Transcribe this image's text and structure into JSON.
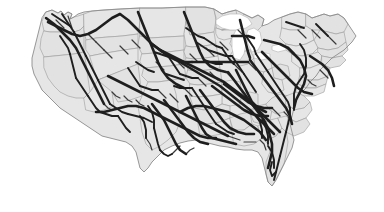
{
  "figure": {
    "kind": "map",
    "width_px": 384,
    "height_px": 212,
    "background_color": "#ffffff",
    "has_labels": false,
    "has_legend": false,
    "has_title_text": false,
    "has_axes": false,
    "projection_note": "Albers-like contiguous United States outline"
  },
  "style": {
    "land_fill": "#e6e6e6",
    "land_fill_alt": "#e2e2e2",
    "state_border_color": "#9a9a9a",
    "state_border_width": 0.6,
    "nation_border_color": "#8c8c8c",
    "nation_border_width": 0.9,
    "lake_fill": "#ffffff",
    "lake_border_color": "#b4b4b4",
    "route_color": "#1e1e1e",
    "route_color_light": "#3a3a3a",
    "route_width_major": 2.6,
    "route_width_medium": 1.9,
    "route_width_minor": 1.2
  },
  "regions": [
    {
      "id": "pacific-northwest",
      "label": "Pacific Northwest",
      "route_density": "medium"
    },
    {
      "id": "california",
      "label": "California",
      "route_density": "medium"
    },
    {
      "id": "mountain-west",
      "label": "Mountain West",
      "route_density": "low"
    },
    {
      "id": "northern-plains",
      "label": "Northern Plains",
      "route_density": "medium"
    },
    {
      "id": "upper-midwest",
      "label": "Upper Midwest",
      "route_density": "high"
    },
    {
      "id": "great-lakes",
      "label": "Great Lakes",
      "route_density": "high"
    },
    {
      "id": "northeast",
      "label": "Northeast",
      "route_density": "low"
    },
    {
      "id": "central-plains",
      "label": "Central Plains",
      "route_density": "high"
    },
    {
      "id": "texas",
      "label": "Texas",
      "route_density": "high"
    },
    {
      "id": "gulf-coast",
      "label": "Gulf Coast",
      "route_density": "high"
    },
    {
      "id": "southeast",
      "label": "Southeast",
      "route_density": "high"
    },
    {
      "id": "florida",
      "label": "Florida",
      "route_density": "medium"
    }
  ],
  "lakes": [
    {
      "id": "lake-superior",
      "label": "Lake Superior"
    },
    {
      "id": "lake-michigan",
      "label": "Lake Michigan"
    },
    {
      "id": "lake-huron",
      "label": "Lake Huron"
    },
    {
      "id": "lake-erie",
      "label": "Lake Erie"
    },
    {
      "id": "lake-ontario",
      "label": "Lake Ontario"
    }
  ],
  "geometry": {
    "nation_outline": "M 46 12 L 52 10 L 58 13 L 61 11 L 64 15 L 68 12 L 72 14 L 70 19 L 74 17 L 78 14 L 84 12 L 92 11 L 104 10 L 120 9 L 140 8 L 162 8 L 186 7 L 205 7 L 214 9 L 222 14 L 228 12 L 236 10 L 244 14 L 252 18 L 258 15 L 264 19 L 262 26 L 268 24 L 274 20 L 282 17 L 290 14 L 298 12 L 306 14 L 312 18 L 318 16 L 324 14 L 330 16 L 338 14 L 344 18 L 348 24 L 352 30 L 356 36 L 352 42 L 348 46 L 344 50 L 338 54 L 332 58 L 326 64 L 320 70 L 316 76 L 310 82 L 306 88 L 300 94 L 296 100 L 294 108 L 292 116 L 290 124 L 292 132 L 294 140 L 292 148 L 288 156 L 284 164 L 280 172 L 276 180 L 272 186 L 268 182 L 266 174 L 264 166 L 262 158 L 258 152 L 252 150 L 244 150 L 236 149 L 228 147 L 220 146 L 212 144 L 204 142 L 196 140 L 188 141 L 180 143 L 172 146 L 164 150 L 158 156 L 152 162 L 148 168 L 144 172 L 140 168 L 138 160 L 136 152 L 132 146 L 126 142 L 118 140 L 110 138 L 102 136 L 96 132 L 90 128 L 84 124 L 78 120 L 72 116 L 66 112 L 60 108 L 54 102 L 48 96 L 42 90 L 38 82 L 34 74 L 32 66 L 32 58 L 34 50 L 36 42 L 38 34 L 40 26 L 42 18 Z",
    "states": [
      "M 46 12 L 52 10 L 58 13 L 61 11 L 64 15 L 68 12 L 72 14 L 70 19 L 74 17 L 78 16 L 84 14 L 84 26 L 80 30 L 74 32 L 66 32 L 58 32 L 50 32 L 44 31 L 42 22 Z",
      "M 44 31 L 50 32 L 58 32 L 66 32 L 74 32 L 80 30 L 84 26 L 84 52 L 74 54 L 64 55 L 54 56 L 44 57 L 40 48 L 41 39 Z",
      "M 84 14 L 92 11 L 104 10 L 120 9 L 140 8 L 140 22 L 138 34 L 122 36 L 108 37 L 96 38 L 86 40 L 84 30 Z",
      "M 86 40 L 96 38 L 108 37 L 122 36 L 138 34 L 138 48 L 124 50 L 112 52 L 100 54 L 90 56 L 86 50 Z",
      "M 90 56 L 100 54 L 112 52 L 124 50 L 138 48 L 138 64 L 128 68 L 118 72 L 108 76 L 98 80 L 94 70 Z",
      "M 44 57 L 54 56 L 64 55 L 74 54 L 84 52 L 86 64 L 88 78 L 90 92 L 84 98 L 76 98 L 68 96 L 60 92 L 54 86 L 48 78 L 44 68 Z",
      "M 84 98 L 90 92 L 98 80 L 108 76 L 112 92 L 114 106 L 104 110 L 94 112 L 86 110 Z",
      "M 98 80 L 108 76 L 118 72 L 128 68 L 138 64 L 140 80 L 142 96 L 130 100 L 118 102 L 112 92 Z",
      "M 140 8 L 162 8 L 186 7 L 186 22 L 184 36 L 166 37 L 150 38 L 140 36 Z",
      "M 140 36 L 150 38 L 166 37 L 184 36 L 184 50 L 168 52 L 154 53 L 142 54 L 138 46 Z",
      "M 142 54 L 154 53 L 168 52 L 184 50 L 184 64 L 170 66 L 156 67 L 144 68 L 140 62 Z",
      "M 144 68 L 156 67 L 170 66 L 184 64 L 186 78 L 172 80 L 158 82 L 148 82 L 142 76 Z",
      "M 142 96 L 148 82 L 158 82 L 172 80 L 176 94 L 178 108 L 180 122 L 176 132 L 168 140 L 160 146 L 152 150 L 146 144 L 142 132 L 140 118 L 138 106 Z",
      "M 186 7 L 205 7 L 214 9 L 216 20 L 214 32 L 202 34 L 190 35 L 186 22 Z",
      "M 186 22 L 190 35 L 202 34 L 214 32 L 216 44 L 204 46 L 192 47 L 186 46 L 184 34 Z",
      "M 186 46 L 192 47 L 204 46 L 216 44 L 218 56 L 206 58 L 194 59 L 186 58 L 184 52 Z",
      "M 186 58 L 194 59 L 206 58 L 218 56 L 220 68 L 208 70 L 196 71 L 188 70 L 186 64 Z",
      "M 188 70 L 196 71 L 208 70 L 220 68 L 222 82 L 210 84 L 198 85 L 190 84 L 186 78 Z",
      "M 190 84 L 198 85 L 210 84 L 222 82 L 222 94 L 210 96 L 198 97 L 190 96 Z",
      "M 214 9 L 222 14 L 228 12 L 236 10 L 238 22 L 230 28 L 222 30 L 216 28 L 216 18 Z",
      "M 216 28 L 222 30 L 230 28 L 238 22 L 240 34 L 232 38 L 224 40 L 218 38 L 216 34 Z",
      "M 222 30 L 230 28 L 238 22 L 244 14 L 252 18 L 258 15 L 264 19 L 262 26 L 256 32 L 248 36 L 240 38 L 238 30 Z",
      "M 232 38 L 240 38 L 248 36 L 256 44 L 250 50 L 242 52 L 234 50 L 230 44 Z",
      "M 234 50 L 242 52 L 250 50 L 254 58 L 248 64 L 240 66 L 232 64 L 230 56 Z",
      "M 222 94 L 222 82 L 232 80 L 240 82 L 242 94 L 240 104 L 230 106 L 222 104 Z",
      "M 240 104 L 242 94 L 250 92 L 258 94 L 258 106 L 250 110 L 242 110 Z",
      "M 190 96 L 198 97 L 210 96 L 222 94 L 222 104 L 214 108 L 204 110 L 194 108 Z",
      "M 194 108 L 204 110 L 214 108 L 222 104 L 230 106 L 230 118 L 220 122 L 208 124 L 198 122 L 194 116 Z",
      "M 198 122 L 208 124 L 220 122 L 230 118 L 232 130 L 222 134 L 210 136 L 200 134 Z",
      "M 230 118 L 240 114 L 250 112 L 252 124 L 244 130 L 234 132 L 232 126 Z",
      "M 232 130 L 244 130 L 252 124 L 258 126 L 262 138 L 254 144 L 244 146 L 234 144 Z",
      "M 250 112 L 258 106 L 266 104 L 272 110 L 270 120 L 262 124 L 254 122 Z",
      "M 258 126 L 262 124 L 270 120 L 278 118 L 282 128 L 276 136 L 268 140 L 262 138 Z",
      "M 266 104 L 272 98 L 280 94 L 288 96 L 290 106 L 284 112 L 276 114 L 270 110 Z",
      "M 254 58 L 262 56 L 270 58 L 272 68 L 264 72 L 256 70 Z",
      "M 272 68 L 280 64 L 288 66 L 290 76 L 282 80 L 274 78 Z",
      "M 264 72 L 272 68 L 274 78 L 282 80 L 284 90 L 276 94 L 268 92 L 262 84 Z",
      "M 262 138 L 268 140 L 276 136 L 282 128 L 286 130 L 288 142 L 286 154 L 284 164 L 280 172 L 276 180 L 272 186 L 268 182 L 266 174 L 266 162 L 270 152 L 268 144 Z",
      "M 282 17 L 290 14 L 298 12 L 306 14 L 306 26 L 298 30 L 290 30 L 282 28 Z",
      "M 306 14 L 312 18 L 318 16 L 324 14 L 330 16 L 338 14 L 344 18 L 348 24 L 344 32 L 336 34 L 328 32 L 320 30 L 312 30 L 306 26 Z",
      "M 282 28 L 290 30 L 298 30 L 306 26 L 312 30 L 314 40 L 306 44 L 296 46 L 286 44 L 280 38 Z",
      "M 314 40 L 320 30 L 328 32 L 336 34 L 344 32 L 346 42 L 338 48 L 328 50 L 318 48 Z",
      "M 286 44 L 296 46 L 306 44 L 314 40 L 318 48 L 312 54 L 302 56 L 292 54 L 286 50 Z",
      "M 318 48 L 328 50 L 338 48 L 346 42 L 348 50 L 342 56 L 332 58 L 322 56 L 318 52 Z",
      "M 292 54 L 302 56 L 312 54 L 318 52 L 322 56 L 320 64 L 310 68 L 300 68 L 292 62 Z",
      "M 322 56 L 332 58 L 342 56 L 346 60 L 340 66 L 330 68 L 322 64 Z",
      "M 300 68 L 310 68 L 320 64 L 322 64 L 330 68 L 328 76 L 318 80 L 308 80 L 300 76 Z",
      "M 300 76 L 308 80 L 318 80 L 328 76 L 326 84 L 316 88 L 306 88 L 298 84 Z",
      "M 298 84 L 306 88 L 316 88 L 326 84 L 324 92 L 314 96 L 304 96 L 296 92 Z",
      "M 286 96 L 296 92 L 304 96 L 310 102 L 304 108 L 294 110 L 286 106 Z",
      "M 290 106 L 294 110 L 304 108 L 310 102 L 312 110 L 306 118 L 296 122 L 288 118 Z",
      "M 288 118 L 296 122 L 306 118 L 310 124 L 304 132 L 294 136 L 286 132 Z",
      "M 278 118 L 286 116 L 288 118 L 286 132 L 282 128 Z"
    ],
    "lakes": [
      "M 216 20 L 222 16 L 230 14 L 240 14 L 248 18 L 252 24 L 246 28 L 238 30 L 230 30 L 222 28 L 216 24 Z",
      "M 236 30 L 242 28 L 246 34 L 246 44 L 244 54 L 240 60 L 234 58 L 232 48 L 232 38 Z",
      "M 248 30 L 254 28 L 260 32 L 262 42 L 258 50 L 252 52 L 248 44 L 246 36 Z",
      "M 254 54 L 262 52 L 270 54 L 270 58 L 262 60 L 254 58 Z",
      "M 272 46 L 280 44 L 286 46 L 286 50 L 278 52 L 272 50 Z"
    ],
    "routes_major": [
      "M 48 22 L 56 26 L 64 30 L 72 34 L 80 36 L 88 34 L 96 30 L 104 24 L 112 18 L 120 14",
      "M 46 18 L 54 24 L 62 32 L 70 40 L 76 48 L 80 56 L 84 64 L 88 72 L 92 80 L 96 88 L 100 96 L 104 104",
      "M 120 14 L 128 20 L 136 28 L 144 36 L 152 44 L 160 50 L 168 56 L 176 60 L 184 62 L 192 62",
      "M 138 12 L 142 22 L 146 32 L 150 42 L 154 52 L 158 62 L 162 70 L 168 78 L 176 84 L 184 88",
      "M 184 12 L 188 22 L 192 32 L 196 42 L 200 52 L 204 60 L 210 66 L 218 70 L 226 72",
      "M 192 62 L 200 62 L 208 62 L 216 62 L 224 62 L 232 62 L 240 62 L 248 62",
      "M 160 50 L 168 54 L 176 58 L 184 62 L 192 66 L 200 70 L 208 74 L 216 78 L 224 82 L 232 88 L 240 94 L 248 100 L 256 108 L 264 116 L 272 124 L 280 132",
      "M 152 44 L 160 50 L 170 56 L 180 62 L 190 68 L 200 74 L 210 80 L 220 86 L 230 94 L 240 102 L 250 110 L 258 118 L 266 126 L 274 134",
      "M 108 76 L 116 80 L 124 84 L 132 88 L 140 92 L 148 96 L 156 100 L 164 104 L 172 108 L 180 112 L 188 116 L 196 120 L 204 124 L 212 128 L 220 132 L 228 136",
      "M 96 112 L 104 112 L 112 110 L 120 108 L 128 106 L 136 106 L 144 108 L 152 112 L 160 116 L 168 120 L 176 124 L 184 128 L 192 132 L 200 136 L 208 138 L 216 138",
      "M 152 104 L 158 112 L 164 120 L 168 128 L 172 136 L 176 144 L 180 150 L 186 154",
      "M 164 100 L 170 108 L 176 116 L 182 124 L 188 132 L 194 138 L 200 142 L 208 144",
      "M 186 96 L 190 104 L 194 112 L 198 120 L 202 128 L 206 134 L 212 138 L 220 140 L 228 142 L 236 144",
      "M 200 90 L 206 98 L 212 106 L 218 114 L 224 122 L 230 128 L 238 132 L 246 134 L 254 134",
      "M 212 86 L 220 92 L 228 98 L 236 104 L 244 110 L 252 114 L 260 116 L 268 116",
      "M 224 84 L 232 90 L 240 96 L 248 102 L 256 106 L 264 108 L 272 108",
      "M 236 70 L 240 78 L 244 86 L 248 94 L 252 102 L 258 108 L 266 112",
      "M 228 72 L 234 80 L 240 88 L 246 96 L 252 104 L 258 112 L 264 120 L 268 128 L 270 136 L 272 144 L 272 152 L 270 160 L 268 168",
      "M 250 60 L 256 68 L 262 76 L 268 84 L 274 92 L 280 100 L 286 108 L 290 116 L 292 124",
      "M 262 52 L 268 58 L 274 64 L 280 70 L 286 76 L 292 82 L 298 88 L 304 92 L 312 94",
      "M 288 48 L 294 54 L 300 60 L 304 68 L 306 76 L 304 84 L 300 92 L 296 100 L 294 108",
      "M 264 40 L 272 42 L 280 44 L 288 48 L 294 54",
      "M 310 56 L 316 60 L 322 64 L 328 70 L 332 78 L 334 86",
      "M 240 20 L 242 28 L 244 36 L 246 44 L 248 52 L 250 58",
      "M 232 36 L 240 36 L 248 36 L 254 38",
      "M 180 112 L 188 108 L 196 106 L 204 106 L 212 108 L 220 110 L 228 112 L 236 116 L 244 120 L 252 126 L 260 132 L 266 140"
    ],
    "routes_medium": [
      "M 52 14 L 58 18 L 64 22 L 70 26",
      "M 62 14 L 66 20 L 70 26 L 74 32",
      "M 74 32 L 78 40 L 82 48 L 86 56",
      "M 86 56 L 90 64 L 94 72 L 98 80",
      "M 98 80 L 102 88 L 106 96 L 110 104",
      "M 110 104 L 116 108 L 122 112 L 128 114",
      "M 128 114 L 136 116 L 144 118 L 152 122",
      "M 128 68 L 132 74 L 136 80 L 140 86",
      "M 140 86 L 146 88 L 152 90 L 158 90",
      "M 136 62 L 142 66 L 148 70 L 154 72",
      "M 154 52 L 160 54 L 166 56 L 172 58",
      "M 168 56 L 172 62 L 176 68 L 180 74",
      "M 180 74 L 186 76 L 192 78 L 198 78",
      "M 166 74 L 172 76 L 178 78 L 184 80",
      "M 174 86 L 180 88 L 186 88 L 192 88",
      "M 192 88 L 196 94 L 200 100 L 204 106",
      "M 204 106 L 208 112 L 212 118 L 216 124",
      "M 216 124 L 222 128 L 228 132 L 234 134",
      "M 196 42 L 202 46 L 208 50 L 214 52",
      "M 214 52 L 220 54 L 226 56 L 232 56",
      "M 204 60 L 210 62 L 216 64 L 222 64",
      "M 232 56 L 236 62 L 240 68 L 244 74",
      "M 244 74 L 248 80 L 252 86 L 256 92",
      "M 186 28 L 192 32 L 198 36 L 204 38",
      "M 204 38 L 210 42 L 216 46 L 222 48",
      "M 222 48 L 226 54 L 230 60 L 234 64",
      "M 246 36 L 250 42 L 254 48 L 256 54",
      "M 256 54 L 260 60 L 264 66 L 268 72",
      "M 268 72 L 272 78 L 276 84 L 280 90",
      "M 280 90 L 284 96 L 288 102 L 290 108",
      "M 290 108 L 290 116 L 288 124 L 286 132",
      "M 286 132 L 284 140 L 282 148 L 280 156",
      "M 280 156 L 278 164 L 276 172 L 274 180",
      "M 276 172 L 272 176 L 270 170 L 272 162",
      "M 268 146 L 272 152 L 274 160 L 274 168",
      "M 262 120 L 266 128 L 268 136 L 268 144",
      "M 256 116 L 260 122 L 262 130 L 262 138",
      "M 300 44 L 304 50 L 306 58 L 306 66",
      "M 306 66 L 304 74 L 300 80 L 296 86",
      "M 296 86 L 294 94 L 294 102 L 294 110",
      "M 316 24 L 320 28 L 324 32 L 328 36",
      "M 286 22 L 292 24 L 298 26 L 304 28",
      "M 60 36 L 64 42 L 68 48 L 70 54",
      "M 70 54 L 72 62 L 74 70 L 76 78",
      "M 76 78 L 80 84 L 84 90 L 88 96",
      "M 88 96 L 92 102 L 96 108 L 100 112",
      "M 100 112 L 106 114 L 112 116 L 118 116",
      "M 118 116 L 122 122 L 126 128 L 130 132",
      "M 148 106 L 152 112 L 154 120 L 154 128",
      "M 154 128 L 156 136 L 158 144 L 160 150",
      "M 160 150 L 164 154 L 168 156 L 172 154",
      "M 140 116 L 144 122 L 146 130 L 146 138"
    ],
    "routes_minor": [
      "M 56 20 L 60 24 L 64 28",
      "M 68 16 L 70 22 L 72 28",
      "M 88 34 L 92 38 L 96 42",
      "M 96 42 L 100 46 L 104 50",
      "M 104 50 L 108 54 L 112 58",
      "M 120 46 L 124 50 L 128 54",
      "M 132 40 L 136 44 L 140 48",
      "M 144 36 L 148 40 L 152 44",
      "M 156 62 L 160 66 L 164 70",
      "M 176 60 L 180 64 L 184 68",
      "M 190 54 L 194 58 L 198 62",
      "M 206 48 L 210 52 L 214 56",
      "M 220 42 L 224 46 L 228 50",
      "M 234 64 L 238 68 L 242 72",
      "M 248 62 L 252 66 L 256 70",
      "M 158 90 L 162 94 L 166 98",
      "M 170 94 L 174 98 L 178 102",
      "M 184 88 L 188 92 L 192 96",
      "M 198 78 L 202 82 L 206 86",
      "M 210 72 L 214 76 L 218 80",
      "M 112 92 L 116 96 L 120 98",
      "M 124 96 L 128 100 L 132 102",
      "M 136 100 L 140 104 L 144 106",
      "M 104 104 L 108 108 L 112 110",
      "M 146 138 L 150 144 L 152 150",
      "M 172 154 L 176 150 L 180 146",
      "M 186 154 L 190 150 L 194 148",
      "M 228 136 L 234 138 L 240 140",
      "M 244 142 L 250 142 L 256 142",
      "M 260 140 L 264 144 L 266 150",
      "M 272 108 L 276 112 L 280 116",
      "M 284 112 L 288 116 L 290 120",
      "M 308 80 L 312 84 L 316 86",
      "M 320 70 L 324 74 L 328 78",
      "M 298 30 L 302 34 L 306 38",
      "M 312 30 L 316 34 L 320 38",
      "M 328 36 L 332 40 L 336 44",
      "M 226 72 L 230 76 L 234 80",
      "M 238 30 L 242 34 L 244 38"
    ]
  }
}
